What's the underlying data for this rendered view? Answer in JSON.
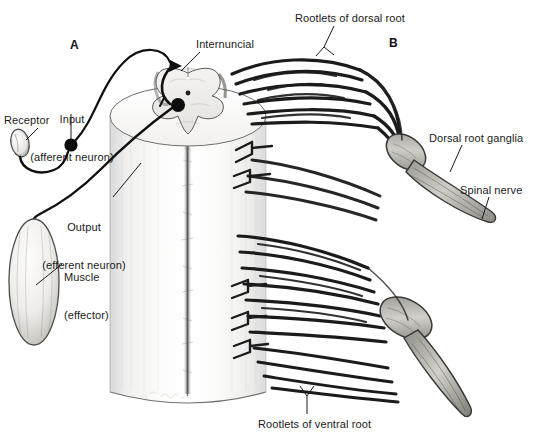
{
  "figure": {
    "background_color": "#ffffff",
    "ink_color": "#1a1a1a",
    "width": 543,
    "height": 446
  },
  "panels": [
    {
      "id": "panel-a",
      "letter": "A",
      "x": 70,
      "y": 38,
      "description": "Reflex arc with receptor, afferent neuron, internuncial neuron, efferent neuron and muscle effector"
    },
    {
      "id": "panel-b",
      "letter": "B",
      "x": 389,
      "y": 36,
      "description": "Dorsal and ventral rootlets converging into dorsal root ganglia and spinal nerve"
    }
  ],
  "labels": [
    {
      "id": "receptor",
      "name": "receptor-label",
      "lines": [
        "Receptor"
      ],
      "x": 4,
      "y": 114,
      "align": "left",
      "leader": {
        "from": [
          40,
          129
        ],
        "to": [
          27,
          141
        ]
      }
    },
    {
      "id": "input-afferent",
      "name": "input-afferent-neuron-label",
      "lines": [
        "Input",
        "(afferent neuron)"
      ],
      "x": 27,
      "y": 88,
      "align": "center",
      "leader": {
        "from": [
          71,
          115
        ],
        "to": [
          71,
          140
        ]
      }
    },
    {
      "id": "output-efferent",
      "name": "output-efferent-neuron-label",
      "lines": [
        "Output",
        "(efferent neuron)"
      ],
      "x": 36,
      "y": 196,
      "align": "center",
      "leader": {
        "from": [
          114,
          196
        ],
        "to": [
          140,
          163
        ]
      }
    },
    {
      "id": "muscle-effector",
      "name": "muscle-effector-label",
      "lines": [
        "Muscle",
        "(effector)"
      ],
      "x": 64,
      "y": 246,
      "align": "left",
      "leader": {
        "from": [
          63,
          264
        ],
        "to": [
          36,
          284
        ]
      }
    },
    {
      "id": "internuncial",
      "name": "internuncial-neuron-label",
      "lines": [
        "Internuncial"
      ],
      "x": 196,
      "y": 38,
      "align": "left",
      "leader": {
        "from": [
          199,
          52
        ],
        "to": [
          181,
          72
        ]
      }
    },
    {
      "id": "rootlets-dorsal",
      "name": "rootlets-of-dorsal-root-label",
      "lines": [
        "Rootlets of dorsal root"
      ],
      "x": 295,
      "y": 12,
      "align": "left",
      "leader": {
        "from": [
          335,
          27
        ],
        "to": [
          325,
          48
        ]
      }
    },
    {
      "id": "dorsal-root-ganglia",
      "name": "dorsal-root-ganglia-label",
      "lines": [
        "Dorsal root ganglia"
      ],
      "x": 429,
      "y": 132,
      "align": "left",
      "leader": {
        "from": [
          462,
          146
        ],
        "to": [
          452,
          172
        ]
      }
    },
    {
      "id": "spinal-nerve",
      "name": "spinal-nerve-label",
      "lines": [
        "Spinal nerve"
      ],
      "x": 460,
      "y": 184,
      "align": "left",
      "leader": {
        "from": [
          489,
          198
        ],
        "to": [
          483,
          218
        ]
      }
    },
    {
      "id": "rootlets-ventral",
      "name": "rootlets-of-ventral-root-label",
      "lines": [
        "Rootlets of ventral root"
      ],
      "x": 258,
      "y": 418,
      "align": "left",
      "leader": {
        "from": [
          307,
          417
        ],
        "to": [
          307,
          395
        ]
      }
    }
  ],
  "structures": {
    "spinal_cord_cylinder": {
      "name": "spinal-cord-cylinder",
      "x": 108,
      "y": 115,
      "width": 160,
      "height": 290
    },
    "cord_cross_section": {
      "name": "spinal-cord-cross-section",
      "cx": 205,
      "cy": 110
    },
    "gray_matter": {
      "name": "gray-matter-butterfly"
    },
    "central_canal": {
      "name": "central-canal-dot",
      "x": 205,
      "y": 93
    },
    "anterior_fissure": {
      "name": "anterior-median-fissure"
    },
    "receptor_organ": {
      "name": "receptor-organ-oval",
      "cx": 20,
      "cy": 143
    },
    "muscle_effector": {
      "name": "muscle-effector-oval",
      "cx": 34,
      "cy": 282,
      "rx": 25,
      "ry": 63
    },
    "afferent_cell_body": {
      "name": "afferent-neuron-cell-body",
      "cx": 71,
      "cy": 145
    },
    "efferent_cell_body": {
      "name": "efferent-neuron-cell-body",
      "cx": 178,
      "cy": 105
    },
    "internuncial_cell_body": {
      "name": "internuncial-neuron-cell-body",
      "cx": 172,
      "cy": 66
    },
    "dorsal_ganglion_upper": {
      "name": "dorsal-root-ganglion-upper",
      "cx": 405,
      "cy": 150
    },
    "dorsal_ganglion_lower": {
      "name": "dorsal-root-ganglion-lower",
      "cx": 410,
      "cy": 330
    },
    "spinal_nerve_upper": {
      "name": "spinal-nerve-upper-trunk"
    },
    "spinal_nerve_lower": {
      "name": "spinal-nerve-lower-trunk"
    },
    "artist_signature": {
      "name": "artist-signature",
      "x": 140,
      "y": 396
    }
  }
}
